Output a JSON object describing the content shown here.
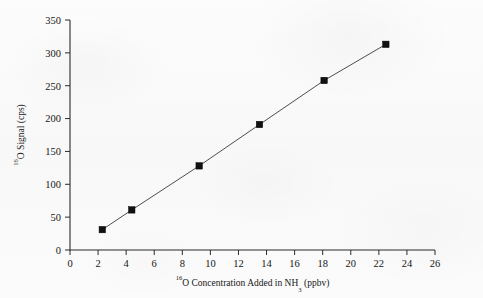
{
  "chart_data": {
    "type": "line",
    "title": "",
    "subtitle": "",
    "xlabel_parts": {
      "sup": "16",
      "main_before": "O Concentration Added in NH",
      "sub": "3",
      "main_after": " (ppbv)"
    },
    "ylabel_parts": {
      "sup": "16",
      "main": "O Signal (cps)"
    },
    "xlabel": "16O Concentration Added in NH3 (ppbv)",
    "ylabel": "16O Signal (cps)",
    "xlim": [
      0,
      26
    ],
    "ylim": [
      0,
      350
    ],
    "xticks": [
      0,
      2,
      4,
      6,
      8,
      10,
      12,
      14,
      16,
      18,
      20,
      22,
      24,
      26
    ],
    "yticks": [
      0,
      50,
      100,
      150,
      200,
      250,
      300,
      350
    ],
    "xtick_labels": [
      "0",
      "2",
      "4",
      "6",
      "8",
      "10",
      "12",
      "14",
      "16",
      "18",
      "20",
      "22",
      "24",
      "26"
    ],
    "ytick_labels": [
      "0",
      "50",
      "100",
      "150",
      "200",
      "250",
      "300",
      "350"
    ],
    "grid": false,
    "legend": false,
    "legend_position": "none",
    "marker": "filled-square",
    "marker_color": "#111111",
    "line_color": "#3a3a3a",
    "axis_color": "#2b2b2b",
    "background_color": "#fbfbfb",
    "series": [
      {
        "name": "16O signal calibration",
        "x": [
          2.3,
          4.4,
          9.2,
          13.5,
          18.1,
          22.5
        ],
        "y": [
          31,
          61,
          128,
          191,
          258,
          313
        ]
      }
    ]
  }
}
